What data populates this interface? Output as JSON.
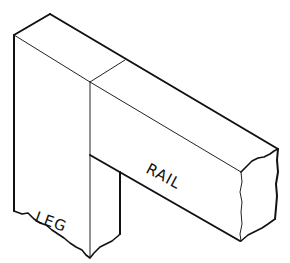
{
  "figure": {
    "type": "isometric joinery sketch",
    "labels": {
      "leg": "LEG",
      "rail": "RAIL"
    },
    "colors": {
      "line": "#111111",
      "background": "#ffffff"
    }
  }
}
